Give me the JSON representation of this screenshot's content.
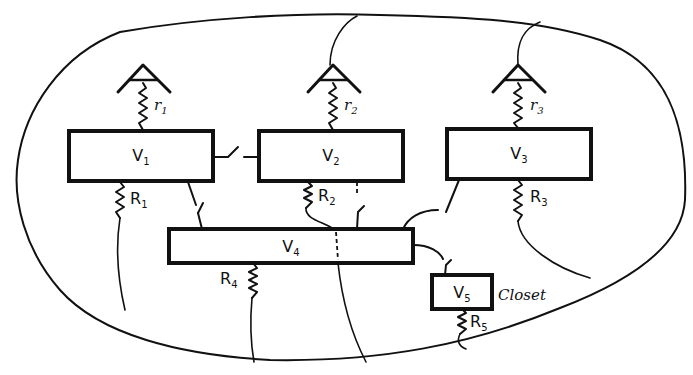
{
  "diagram": {
    "type": "grounding / isolation network diagram",
    "boxes": [
      {
        "id": "V1",
        "label": "V",
        "sub": "1"
      },
      {
        "id": "V2",
        "label": "V",
        "sub": "2"
      },
      {
        "id": "V3",
        "label": "V",
        "sub": "3"
      },
      {
        "id": "V4",
        "label": "V",
        "sub": "4"
      },
      {
        "id": "V5",
        "label": "V",
        "sub": "5",
        "annotation": "Closet"
      }
    ],
    "resistors": [
      {
        "id": "r1",
        "label": "r",
        "sub": "1"
      },
      {
        "id": "r2",
        "label": "r",
        "sub": "2"
      },
      {
        "id": "r3",
        "label": "r",
        "sub": "3"
      },
      {
        "id": "R1",
        "label": "R",
        "sub": "1"
      },
      {
        "id": "R2",
        "label": "R",
        "sub": "2"
      },
      {
        "id": "R3",
        "label": "R",
        "sub": "3"
      },
      {
        "id": "R4",
        "label": "R",
        "sub": "4"
      },
      {
        "id": "R5",
        "label": "R",
        "sub": "5"
      }
    ],
    "ground_symbols": 3
  }
}
